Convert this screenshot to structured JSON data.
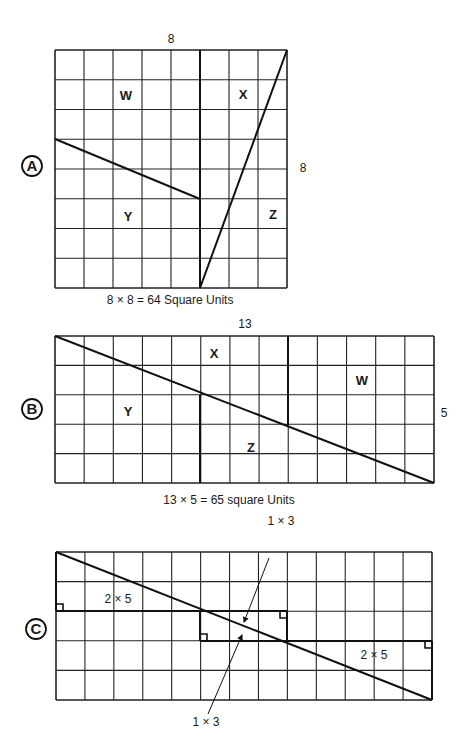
{
  "figures": [
    {
      "id": "A",
      "marker": "A",
      "cols": 8,
      "rows": 8,
      "top_label": "8",
      "side_label": "8",
      "caption": "8 × 8 = 64 Square Units",
      "regions": [
        "W",
        "X",
        "Y",
        "Z"
      ]
    },
    {
      "id": "B",
      "marker": "B",
      "cols": 13,
      "rows": 5,
      "top_label": "13",
      "side_label": "5",
      "caption": "13 × 5 = 65 square Units",
      "regions": [
        "X",
        "W",
        "Y",
        "Z"
      ]
    },
    {
      "id": "C",
      "marker": "C",
      "cols": 13,
      "rows": 5,
      "labels": {
        "left_rect": "2 × 5",
        "right_rect": "2 × 5",
        "top_sliver": "1 × 3",
        "bottom_sliver": "1 × 3"
      }
    }
  ]
}
